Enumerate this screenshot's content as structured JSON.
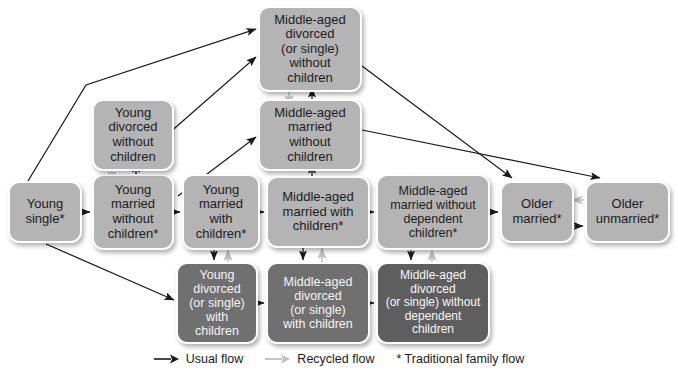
{
  "diagram": {
    "colors": {
      "box_light": "#b4b4b4",
      "box_mid": "#8c8c8c",
      "box_dark": "#707070",
      "box_darker": "#5e5e5e",
      "usual_flow_arrow": "#1a1a1a",
      "recycled_flow_arrow": "#bfbfbf",
      "background": "#ffffff"
    },
    "nodes": [
      {
        "id": "young-single",
        "label": "Young\nsingle*",
        "tone": "tone-light",
        "x": 8,
        "y": 181,
        "w": 74,
        "h": 62,
        "fontSize": 13
      },
      {
        "id": "young-married-no-kids",
        "label": "Young\nmarried\nwithout\nchildren*",
        "tone": "tone-light",
        "x": 92,
        "y": 174,
        "w": 82,
        "h": 76,
        "fontSize": 13
      },
      {
        "id": "young-married-kids",
        "label": "Young\nmarried\nwith\nchildren*",
        "tone": "tone-light",
        "x": 182,
        "y": 174,
        "w": 78,
        "h": 76,
        "fontSize": 13
      },
      {
        "id": "midaged-married-kids",
        "label": "Middle-aged\nmarried with\nchildren*",
        "tone": "tone-light",
        "x": 266,
        "y": 176,
        "w": 104,
        "h": 72,
        "fontSize": 13
      },
      {
        "id": "midaged-married-no-dep",
        "label": "Middle-aged\nmarried without\ndependent\nchildren*",
        "tone": "tone-light",
        "x": 376,
        "y": 174,
        "w": 114,
        "h": 76,
        "fontSize": 12.5
      },
      {
        "id": "older-married",
        "label": "Older\nmarried*",
        "tone": "tone-light",
        "x": 500,
        "y": 181,
        "w": 74,
        "h": 62,
        "fontSize": 13
      },
      {
        "id": "older-unmarried",
        "label": "Older\nunmarried*",
        "tone": "tone-light",
        "x": 585,
        "y": 181,
        "w": 85,
        "h": 62,
        "fontSize": 13
      },
      {
        "id": "young-divorced-no-kids",
        "label": "Young\ndivorced\nwithout\nchildren",
        "tone": "tone-light",
        "x": 92,
        "y": 99,
        "w": 82,
        "h": 72,
        "fontSize": 13
      },
      {
        "id": "midaged-married-no-kids",
        "label": "Middle-aged\nmarried\nwithout\nchildren",
        "tone": "tone-light",
        "x": 258,
        "y": 99,
        "w": 104,
        "h": 72,
        "fontSize": 13
      },
      {
        "id": "midaged-divorced-no-kids",
        "label": "Middle-aged\ndivorced\n(or single)\nwithout\nchildren",
        "tone": "tone-light",
        "x": 258,
        "y": 6,
        "w": 104,
        "h": 86,
        "fontSize": 13
      },
      {
        "id": "young-divorced-kids",
        "label": "Young\ndivorced\n(or single)\nwith\nchildren",
        "tone": "tone-dark",
        "x": 176,
        "y": 262,
        "w": 82,
        "h": 82,
        "fontSize": 12.5
      },
      {
        "id": "midaged-divorced-kids",
        "label": "Middle-aged\ndivorced\n(or single)\nwith children",
        "tone": "tone-dark",
        "x": 266,
        "y": 262,
        "w": 104,
        "h": 82,
        "fontSize": 12.5
      },
      {
        "id": "midaged-divorced-no-dep",
        "label": "Middle-aged\ndivorced\n(or single) without\ndependent\nchildren",
        "tone": "tone-darker",
        "x": 376,
        "y": 262,
        "w": 114,
        "h": 82,
        "fontSize": 12
      }
    ],
    "legend": [
      {
        "id": "usual-flow",
        "label": "Usual flow",
        "marker": "arrow-dark"
      },
      {
        "id": "recycled-flow",
        "label": "Recycled flow",
        "marker": "arrow-light"
      },
      {
        "id": "traditional-family-flow",
        "label": "* Traditional family flow",
        "marker": "asterisk"
      }
    ]
  }
}
